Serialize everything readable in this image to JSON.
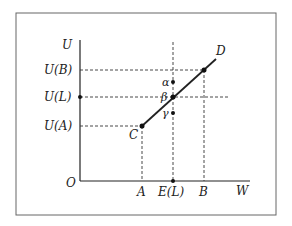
{
  "diagram": {
    "axes": {
      "y_label": "U",
      "x_label": "W",
      "origin_label": "O"
    },
    "y_ticks": [
      {
        "label": "U(B)",
        "y": 70
      },
      {
        "label": "U(L)",
        "y": 97
      },
      {
        "label": "U(A)",
        "y": 126
      }
    ],
    "x_ticks": [
      {
        "label": "A",
        "x": 142
      },
      {
        "label": "E(L)",
        "x": 173
      },
      {
        "label": "B",
        "x": 204
      }
    ],
    "points": {
      "C": "C",
      "D": "D",
      "alpha": "α",
      "beta": "β",
      "gamma": "γ"
    },
    "colors": {
      "line": "#222222",
      "frame": "#555555"
    }
  }
}
